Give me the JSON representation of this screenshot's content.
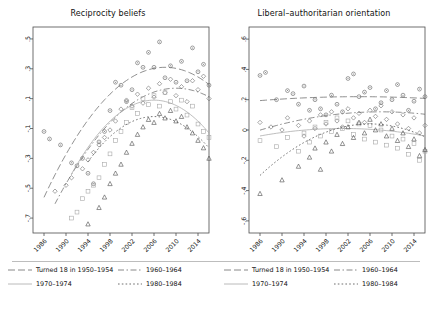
{
  "figure": {
    "background": "#ffffff",
    "axis_color": "#4d4d4d",
    "text_color": "#111111"
  },
  "panels": [
    {
      "id": "reciprocity-beliefs",
      "title": "Reciprocity beliefs",
      "ylim": [
        -0.8,
        0.58
      ],
      "yticks": [
        ".5",
        ".3",
        ".1",
        "-.1",
        "-.3",
        "-.5",
        "-.7"
      ],
      "ytick_values": [
        0.5,
        0.3,
        0.1,
        -0.1,
        -0.3,
        -0.5,
        -0.7
      ],
      "xlim": [
        1984,
        2016
      ],
      "xticks": [
        "1986",
        "1990",
        "1994",
        "1998",
        "2002",
        "2006",
        "2010",
        "2014"
      ],
      "xtick_values": [
        1986,
        1990,
        1994,
        1998,
        2002,
        2006,
        2010,
        2014
      ]
    },
    {
      "id": "liberal-authoritarian-orientation",
      "title": "Liberal–authoritarian orientation",
      "ylim": [
        -0.68,
        0.68
      ],
      "yticks": [
        ".6",
        ".4",
        ".2",
        "0",
        "-.2",
        "-.4",
        "-.6"
      ],
      "ytick_values": [
        0.6,
        0.4,
        0.2,
        0.0,
        -0.2,
        -0.4,
        -0.6
      ],
      "xlim": [
        1984,
        2016
      ],
      "xticks": [
        "1986",
        "1990",
        "1994",
        "1998",
        "2002",
        "2006",
        "2010",
        "2014"
      ],
      "xtick_values": [
        1986,
        1990,
        1994,
        1998,
        2002,
        2006,
        2010,
        2014
      ]
    }
  ],
  "legend": {
    "entries": [
      {
        "label": "Turned 18 in 1950–1954",
        "dash": "7,3",
        "marker": "circle",
        "color": "#6b6b6b"
      },
      {
        "label": "1960–1964",
        "dash": "6,2.5,1.5,2.5",
        "marker": "diamond",
        "color": "#6b6b6b"
      },
      {
        "label": "1970–1974",
        "dash": "none",
        "marker": "square",
        "color": "#a8a8a8"
      },
      {
        "label": "1980–1984",
        "dash": "1.6,2.2",
        "marker": "triangle",
        "color": "#4a4a4a"
      }
    ]
  },
  "chart_data": [
    {
      "type": "scatter",
      "title": "Reciprocity beliefs",
      "xlabel": "",
      "ylabel": "",
      "xlim": [
        1984,
        2016
      ],
      "ylim": [
        -0.8,
        0.58
      ],
      "grid": false,
      "legend_position": "bottom",
      "series": [
        {
          "name": "Turned 18 in 1950-1954",
          "marker": "circle",
          "points": [
            [
              1986,
              -0.12
            ],
            [
              1987,
              -0.17
            ],
            [
              1989,
              -0.21
            ],
            [
              1991,
              -0.33
            ],
            [
              1992,
              -0.35
            ],
            [
              1993,
              -0.3
            ],
            [
              1994,
              -0.4
            ],
            [
              1995,
              -0.47
            ],
            [
              1996,
              -0.19
            ],
            [
              1997,
              -0.12
            ],
            [
              1998,
              0.02
            ],
            [
              1999,
              0.21
            ],
            [
              2000,
              0.19
            ],
            [
              2001,
              0.08
            ],
            [
              2002,
              0.16
            ],
            [
              2003,
              0.34
            ],
            [
              2004,
              0.31
            ],
            [
              2005,
              0.41
            ],
            [
              2006,
              0.31
            ],
            [
              2007,
              0.48
            ],
            [
              2008,
              0.24
            ],
            [
              2009,
              0.32
            ],
            [
              2010,
              0.21
            ],
            [
              2011,
              0.35
            ],
            [
              2012,
              0.22
            ],
            [
              2013,
              0.44
            ],
            [
              2014,
              0.28
            ],
            [
              2015,
              0.33
            ],
            [
              2016,
              0.19
            ]
          ],
          "fit": {
            "type": "quadratic",
            "vertex_x": 2008,
            "vertex_y": 0.31,
            "a": -0.0018
          }
        },
        {
          "name": "1960-1964",
          "marker": "diamond",
          "points": [
            [
              1988,
              -0.52
            ],
            [
              1990,
              -0.48
            ],
            [
              1991,
              -0.43
            ],
            [
              1993,
              -0.37
            ],
            [
              1994,
              -0.31
            ],
            [
              1995,
              -0.26
            ],
            [
              1996,
              -0.21
            ],
            [
              1997,
              -0.16
            ],
            [
              1998,
              -0.11
            ],
            [
              1999,
              -0.05
            ],
            [
              2000,
              0.03
            ],
            [
              2001,
              0.09
            ],
            [
              2002,
              0.05
            ],
            [
              2003,
              0.13
            ],
            [
              2004,
              0.07
            ],
            [
              2005,
              0.17
            ],
            [
              2006,
              0.11
            ],
            [
              2007,
              0.2
            ],
            [
              2008,
              0.14
            ],
            [
              2009,
              0.23
            ],
            [
              2010,
              0.12
            ],
            [
              2011,
              0.18
            ],
            [
              2012,
              0.08
            ],
            [
              2013,
              0.22
            ],
            [
              2014,
              0.16
            ],
            [
              2015,
              0.25
            ],
            [
              2016,
              0.1
            ]
          ],
          "fit": {
            "type": "quadratic",
            "vertex_x": 2010,
            "vertex_y": 0.17,
            "a": -0.0016
          }
        },
        {
          "name": "1970-1974",
          "marker": "square",
          "points": [
            [
              1991,
              -0.7
            ],
            [
              1992,
              -0.66
            ],
            [
              1993,
              -0.57
            ],
            [
              1994,
              -0.52
            ],
            [
              1995,
              -0.48
            ],
            [
              1996,
              -0.43
            ],
            [
              1997,
              -0.34
            ],
            [
              1998,
              -0.27
            ],
            [
              1999,
              -0.18
            ],
            [
              2000,
              -0.12
            ],
            [
              2001,
              -0.06
            ],
            [
              2002,
              0.04
            ],
            [
              2003,
              0.0
            ],
            [
              2004,
              0.1
            ],
            [
              2005,
              0.06
            ],
            [
              2006,
              0.12
            ],
            [
              2007,
              0.05
            ],
            [
              2008,
              0.14
            ],
            [
              2009,
              0.08
            ],
            [
              2010,
              0.03
            ],
            [
              2011,
              0.09
            ],
            [
              2012,
              -0.01
            ],
            [
              2013,
              0.05
            ],
            [
              2014,
              -0.07
            ],
            [
              2015,
              -0.12
            ],
            [
              2016,
              -0.16
            ]
          ],
          "fit": {
            "type": "quadratic",
            "vertex_x": 2006,
            "vertex_y": 0.09,
            "a": -0.0022
          }
        },
        {
          "name": "1980-1984",
          "marker": "triangle",
          "points": [
            [
              1994,
              -0.74
            ],
            [
              1996,
              -0.63
            ],
            [
              1997,
              -0.56
            ],
            [
              1998,
              -0.47
            ],
            [
              1999,
              -0.4
            ],
            [
              2000,
              -0.34
            ],
            [
              2001,
              -0.26
            ],
            [
              2002,
              -0.2
            ],
            [
              2003,
              -0.14
            ],
            [
              2004,
              -0.09
            ],
            [
              2005,
              -0.04
            ],
            [
              2006,
              -0.06
            ],
            [
              2007,
              0.0
            ],
            [
              2008,
              -0.03
            ],
            [
              2009,
              0.02
            ],
            [
              2010,
              -0.05
            ],
            [
              2011,
              -0.02
            ],
            [
              2012,
              -0.09
            ],
            [
              2013,
              -0.13
            ],
            [
              2014,
              -0.18
            ],
            [
              2015,
              -0.23
            ],
            [
              2016,
              -0.3
            ]
          ],
          "fit": {
            "type": "quadratic",
            "vertex_x": 2006,
            "vertex_y": -0.02,
            "a": -0.0021
          }
        }
      ]
    },
    {
      "type": "scatter",
      "title": "Liberal-authoritarian orientation",
      "xlabel": "",
      "ylabel": "",
      "xlim": [
        1984,
        2016
      ],
      "ylim": [
        -0.68,
        0.68
      ],
      "grid": false,
      "legend_position": "bottom",
      "series": [
        {
          "name": "Turned 18 in 1950-1954",
          "marker": "circle",
          "points": [
            [
              1986,
              0.36
            ],
            [
              1987,
              0.38
            ],
            [
              1989,
              0.2
            ],
            [
              1991,
              0.26
            ],
            [
              1992,
              0.24
            ],
            [
              1993,
              0.17
            ],
            [
              1994,
              0.29
            ],
            [
              1995,
              0.13
            ],
            [
              1996,
              0.2
            ],
            [
              1997,
              0.14
            ],
            [
              1998,
              0.1
            ],
            [
              1999,
              0.23
            ],
            [
              2000,
              0.17
            ],
            [
              2001,
              0.12
            ],
            [
              2002,
              0.34
            ],
            [
              2003,
              0.37
            ],
            [
              2004,
              0.22
            ],
            [
              2005,
              0.25
            ],
            [
              2006,
              0.28
            ],
            [
              2007,
              0.14
            ],
            [
              2008,
              0.18
            ],
            [
              2009,
              0.26
            ],
            [
              2010,
              0.2
            ],
            [
              2011,
              0.3
            ],
            [
              2012,
              0.23
            ],
            [
              2013,
              0.13
            ],
            [
              2014,
              0.19
            ],
            [
              2015,
              0.27
            ],
            [
              2016,
              0.22
            ]
          ],
          "fit": {
            "type": "quadratic",
            "vertex_x": 2004,
            "vertex_y": 0.22,
            "a": -8e-05
          }
        },
        {
          "name": "1960-1964",
          "marker": "diamond",
          "points": [
            [
              1986,
              0.05
            ],
            [
              1988,
              0.02
            ],
            [
              1990,
              0.0
            ],
            [
              1991,
              0.08
            ],
            [
              1993,
              0.03
            ],
            [
              1994,
              -0.04
            ],
            [
              1995,
              0.06
            ],
            [
              1996,
              0.01
            ],
            [
              1997,
              0.1
            ],
            [
              1998,
              0.04
            ],
            [
              1999,
              0.12
            ],
            [
              2000,
              0.06
            ],
            [
              2001,
              0.02
            ],
            [
              2002,
              0.14
            ],
            [
              2003,
              0.08
            ],
            [
              2004,
              0.11
            ],
            [
              2005,
              0.05
            ],
            [
              2006,
              0.13
            ],
            [
              2007,
              0.09
            ],
            [
              2008,
              0.16
            ],
            [
              2009,
              0.07
            ],
            [
              2010,
              0.12
            ],
            [
              2011,
              0.04
            ],
            [
              2012,
              0.1
            ],
            [
              2013,
              0.01
            ],
            [
              2014,
              0.08
            ],
            [
              2015,
              -0.02
            ],
            [
              2016,
              0.03
            ]
          ],
          "fit": {
            "type": "quadratic",
            "vertex_x": 2008,
            "vertex_y": 0.12,
            "a": -0.00025
          }
        },
        {
          "name": "1970-1974",
          "marker": "square",
          "points": [
            [
              1986,
              -0.07
            ],
            [
              1989,
              -0.11
            ],
            [
              1991,
              -0.05
            ],
            [
              1993,
              -0.14
            ],
            [
              1994,
              -0.02
            ],
            [
              1995,
              -0.08
            ],
            [
              1996,
              0.02
            ],
            [
              1997,
              -0.04
            ],
            [
              1998,
              0.05
            ],
            [
              1999,
              -0.01
            ],
            [
              2000,
              0.08
            ],
            [
              2001,
              0.01
            ],
            [
              2002,
              0.06
            ],
            [
              2003,
              -0.03
            ],
            [
              2004,
              0.04
            ],
            [
              2005,
              -0.06
            ],
            [
              2006,
              0.03
            ],
            [
              2007,
              -0.08
            ],
            [
              2008,
              0.0
            ],
            [
              2009,
              -0.1
            ],
            [
              2010,
              -0.04
            ],
            [
              2011,
              -0.12
            ],
            [
              2012,
              -0.06
            ],
            [
              2013,
              -0.16
            ],
            [
              2014,
              -0.09
            ],
            [
              2015,
              -0.2
            ],
            [
              2016,
              -0.14
            ]
          ],
          "fit": {
            "type": "quadratic",
            "vertex_x": 2001,
            "vertex_y": 0.01,
            "a": -0.00022
          }
        },
        {
          "name": "1980-1984",
          "marker": "triangle",
          "points": [
            [
              1986,
              -0.42
            ],
            [
              1990,
              -0.33
            ],
            [
              1993,
              -0.24
            ],
            [
              1995,
              -0.18
            ],
            [
              1996,
              -0.12
            ],
            [
              1997,
              -0.26
            ],
            [
              1998,
              -0.08
            ],
            [
              1999,
              -0.14
            ],
            [
              2000,
              -0.03
            ],
            [
              2001,
              -0.09
            ],
            [
              2002,
              0.02
            ],
            [
              2003,
              -0.05
            ],
            [
              2004,
              0.05
            ],
            [
              2005,
              -0.02
            ],
            [
              2006,
              0.07
            ],
            [
              2007,
              0.0
            ],
            [
              2008,
              0.04
            ],
            [
              2009,
              -0.04
            ],
            [
              2010,
              0.01
            ],
            [
              2011,
              -0.07
            ],
            [
              2012,
              -0.02
            ],
            [
              2013,
              -0.11
            ],
            [
              2014,
              -0.06
            ],
            [
              2015,
              -0.17
            ],
            [
              2016,
              -0.13
            ]
          ],
          "fit": {
            "type": "quadratic",
            "vertex_x": 2006,
            "vertex_y": 0.04,
            "a": -0.00085
          }
        }
      ]
    }
  ]
}
